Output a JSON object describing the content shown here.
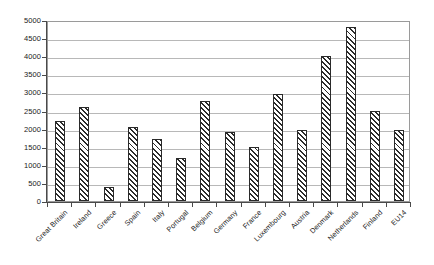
{
  "chart_data": {
    "type": "bar",
    "title": "",
    "subtitle": "",
    "xlabel": "",
    "ylabel": "",
    "ylim": [
      0,
      5000
    ],
    "ytick_interval": 500,
    "grid": true,
    "legend": false,
    "legend_position": "none",
    "bar_style": {
      "fill": "diagonal-hatch",
      "hatch_color": "#2b2b2b",
      "background_color": "#ffffff",
      "border_color": "#2a2a2a"
    },
    "axis_color": "#4a4a4a",
    "gridline_color": "#b8b8b8",
    "plot_border_color": "#9a9a9a",
    "categories": [
      "Great Britain",
      "Ireland",
      "Greece",
      "Spain",
      "Italy",
      "Portugal",
      "Belgium",
      "Germany",
      "France",
      "Luxembourg",
      "Austria",
      "Denmark",
      "Netherlands",
      "Finland",
      "EU14"
    ],
    "values": [
      2200,
      2600,
      400,
      2050,
      1700,
      1200,
      2750,
      1900,
      1500,
      2950,
      1950,
      4000,
      4800,
      2500,
      1950
    ],
    "ytick_labels": [
      "5000",
      "4500",
      "4000",
      "3500",
      "3000",
      "2500",
      "2000",
      "1500",
      "1000",
      "500",
      "0"
    ],
    "ytick_values": [
      5000,
      4500,
      4000,
      3500,
      3000,
      2500,
      2000,
      1500,
      1000,
      500,
      0
    ]
  }
}
